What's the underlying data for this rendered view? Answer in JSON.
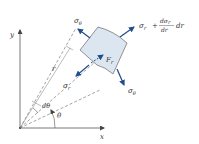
{
  "diagram": {
    "axes": {
      "x_label": "x",
      "y_label": "y"
    },
    "labels": {
      "sigma_theta_top": "σ",
      "sigma_theta_top_sub": "θ",
      "sigma_theta_bottom": "σ",
      "sigma_theta_bottom_sub": "θ",
      "sigma_r": "σ",
      "sigma_r_sub": "r",
      "sigma_r_plus": "σ",
      "sigma_r_plus_sub": "r",
      "plus": "+",
      "frac_num": "dσ",
      "frac_num_sub": "r",
      "frac_den": "dr",
      "dr_tail": "dr",
      "body_force": "F",
      "body_force_sub": "r",
      "radius": "r",
      "d_theta": "dθ",
      "theta": "θ"
    },
    "colors": {
      "arrow": "#1f4e8c",
      "element_fill": "#dbe6f0",
      "element_stroke": "#777777",
      "axis": "#555555"
    }
  }
}
